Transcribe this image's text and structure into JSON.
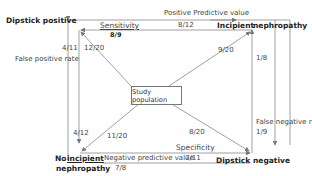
{
  "nodes": {
    "top_left": "Dipstick positive",
    "top_right_a": "Incipient",
    "top_right_b": "nephropathy",
    "bottom_left_a": "No",
    "bottom_left_b": "incipient",
    "bottom_left_c": "nephropathy",
    "bottom_right_a": "Dipstick",
    "bottom_right_b": "negative",
    "center": "Study population"
  },
  "labels": {
    "sensitivity": "Sensitivity",
    "sensitivity_value": "8/9",
    "ppv": "Positive Predictive value",
    "ppv_value": "8/12",
    "fpr": "False positive rate",
    "fpr_value": "4/11",
    "tl_diag": "12/20",
    "tr_diag": "9/20",
    "tr_vert": "1/8",
    "fnr": "False negative rate",
    "fnr_value": "1/9",
    "bl_vert": "4/12",
    "bl_diag": "11/20",
    "br_diag": "8/20",
    "specificity": "Specificity",
    "npv": "Negative predictive value",
    "npv_value": "7/11",
    "bl_bottom": "7/8"
  }
}
